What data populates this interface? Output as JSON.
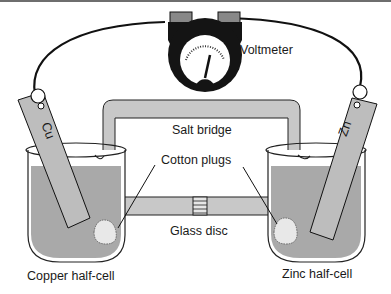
{
  "diagram": {
    "type": "galvanic-cell",
    "labels": {
      "voltmeter": "Voltmeter",
      "salt_bridge": "Salt bridge",
      "cotton_plugs": "Cotton plugs",
      "glass_disc": "Glass disc",
      "copper_half_cell": "Copper half-cell",
      "zinc_half_cell": "Zinc half-cell"
    },
    "electrodes": {
      "left": "Cu",
      "right": "Zn"
    },
    "colors": {
      "solution": "#a9a9a9",
      "bridge": "#c8c8c8",
      "electrode": "#bdbdbd",
      "outline": "#111111",
      "meter_body": "#141414"
    }
  }
}
